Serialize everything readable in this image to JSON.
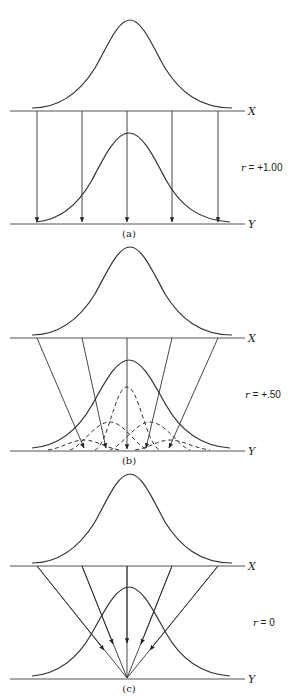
{
  "figure": {
    "panels": [
      {
        "id": "a",
        "caption": "(a)",
        "r_label": "r = +1.00",
        "r_var": "r",
        "r_value": "= +1.00",
        "x_axis_label": "X",
        "y_axis_label": "Y",
        "description": "Perfect correlation: each X value maps straight down to the same Y value"
      },
      {
        "id": "b",
        "caption": "(b)",
        "r_label": "r = +.50",
        "r_var": "r",
        "r_value": "= +.50",
        "x_axis_label": "X",
        "y_axis_label": "Y",
        "description": "Moderate correlation: X values map to narrower conditional Y distributions (dashed)"
      },
      {
        "id": "c",
        "caption": "(c)",
        "r_label": "r = 0",
        "r_var": "r",
        "r_value": "= 0",
        "x_axis_label": "X",
        "y_axis_label": "Y",
        "description": "No correlation: all X values map to the mean of Y"
      }
    ],
    "colors": {
      "line": "#333333",
      "axis": "#555555",
      "background": "#ffffff"
    }
  }
}
